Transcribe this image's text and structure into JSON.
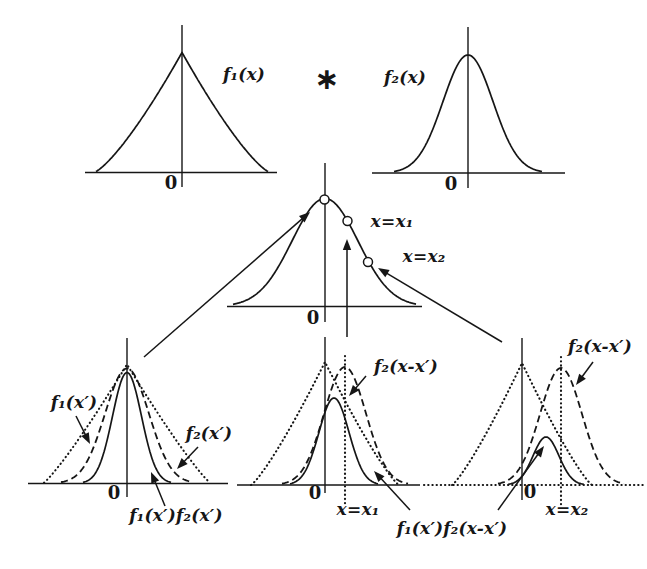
{
  "labels": {
    "f1_of_x": "f₁(x)",
    "star": "∗",
    "f2_of_x": "f₂(x)",
    "x_eq_x1": "x=x₁",
    "x_eq_x2": "x=x₂",
    "zero": "0",
    "f1_of_xp": "f₁(x′)",
    "f2_of_xp": "f₂(x′)",
    "f1f2_of_xp": "f₁(x′)f₂(x′)",
    "f2_of_x_minus_xp": "f₂(x-x′)",
    "f1f2_product": "f₁(x′)f₂(x-x′)"
  },
  "figure": {
    "ink": "#161616",
    "axes": [
      {
        "name": "axis-top-left-vertical",
        "x1": 182,
        "y1": 25,
        "x2": 182,
        "y2": 187
      },
      {
        "name": "axis-top-left-horizontal",
        "x1": 85,
        "y1": 172.5,
        "x2": 277,
        "y2": 172.5
      },
      {
        "name": "axis-top-right-vertical",
        "x1": 468,
        "y1": 27,
        "x2": 468,
        "y2": 188
      },
      {
        "name": "axis-top-right-horizontal",
        "x1": 372,
        "y1": 173,
        "x2": 565,
        "y2": 173
      },
      {
        "name": "axis-middle-vertical",
        "x1": 325,
        "y1": 163,
        "x2": 325,
        "y2": 322
      },
      {
        "name": "axis-middle-horizontal",
        "x1": 227,
        "y1": 306.5,
        "x2": 422,
        "y2": 306.5
      },
      {
        "name": "axis-bottom-left-vertical",
        "x1": 127,
        "y1": 338,
        "x2": 127,
        "y2": 497
      },
      {
        "name": "axis-bottom-left-horizontal",
        "x1": 28,
        "y1": 483.5,
        "x2": 228,
        "y2": 483.5
      },
      {
        "name": "axis-bottom-middle-vertical",
        "x1": 325,
        "y1": 337,
        "x2": 325,
        "y2": 493
      },
      {
        "name": "axis-bottom-middle-horizontal",
        "x1": 237,
        "y1": 485,
        "x2": 420,
        "y2": 485
      },
      {
        "name": "axis-bottom-right-vertical",
        "x1": 522,
        "y1": 338,
        "x2": 522,
        "y2": 500
      }
    ],
    "dotted_lines": [
      {
        "name": "baseline-dotted-extension",
        "x1": 424,
        "y1": 485,
        "x2": 643,
        "y2": 485
      },
      {
        "name": "x1-marker-dotted-line",
        "x1": 345,
        "y1": 356,
        "x2": 345,
        "y2": 505
      },
      {
        "name": "x2-marker-dotted-line",
        "x1": 561,
        "y1": 357,
        "x2": 561,
        "y2": 505
      }
    ],
    "curves": [
      {
        "name": "f1-top-curve",
        "kind": "tri",
        "cx": 182,
        "base": 172.5,
        "h": 120,
        "W": 88,
        "q": 1.3,
        "x0": 96,
        "x1": 268,
        "style": "solid"
      },
      {
        "name": "f2-top-curve",
        "kind": "gauss",
        "cx": 468,
        "base": 173,
        "h": 118,
        "sigma": 25,
        "x0": 394,
        "x1": 542,
        "style": "solid"
      },
      {
        "name": "convolution-curve",
        "kind": "gauss",
        "cx": 325,
        "base": 306.5,
        "h": 108,
        "sigma": 33,
        "x0": 233,
        "x1": 416,
        "style": "solid"
      },
      {
        "name": "bl-f1-curve",
        "kind": "tri",
        "cx": 127,
        "base": 483.5,
        "h": 119,
        "W": 84,
        "q": 1.15,
        "x0": 44,
        "x1": 210,
        "style": "dotted"
      },
      {
        "name": "bl-f2-curve",
        "kind": "gauss",
        "cx": 127,
        "base": 483.5,
        "h": 115,
        "sigma": 22,
        "x0": 61,
        "x1": 193,
        "style": "dashed"
      },
      {
        "name": "bl-product-curve",
        "kind": "gauss",
        "cx": 127,
        "base": 483.5,
        "h": 111,
        "sigma": 14.5,
        "x0": 83,
        "x1": 171,
        "style": "solid"
      },
      {
        "name": "bm-f1-curve",
        "kind": "tri",
        "cx": 325,
        "base": 485,
        "h": 123,
        "W": 74,
        "q": 1.2,
        "x0": 251,
        "x1": 399,
        "style": "dotted"
      },
      {
        "name": "bm-f2-curve",
        "kind": "gauss",
        "cx": 345,
        "base": 485,
        "h": 118,
        "sigma": 21,
        "x0": 282,
        "x1": 408,
        "style": "dashed"
      },
      {
        "name": "bm-product-curve",
        "kind": "gauss",
        "cx": 334,
        "base": 485,
        "h": 87,
        "sigma": 15,
        "x0": 290,
        "x1": 378,
        "style": "solid"
      },
      {
        "name": "br-f1-curve",
        "kind": "tri",
        "cx": 522,
        "base": 485,
        "h": 122,
        "W": 70,
        "q": 1.2,
        "x0": 452,
        "x1": 592,
        "style": "dotted"
      },
      {
        "name": "br-f2-curve",
        "kind": "gauss",
        "cx": 561,
        "base": 485,
        "h": 117,
        "sigma": 21,
        "x0": 498,
        "x1": 624,
        "style": "dashed"
      },
      {
        "name": "br-product-curve",
        "kind": "gauss",
        "cx": 546,
        "base": 485,
        "h": 48,
        "sigma": 13,
        "x0": 508,
        "x1": 584,
        "style": "solid"
      }
    ],
    "circles": [
      {
        "name": "point-at-peak",
        "cx": 324.5,
        "cy": 199.5,
        "r": 4.5
      },
      {
        "name": "point-at-x1",
        "cx": 347.5,
        "cy": 221,
        "r": 4.5
      },
      {
        "name": "point-at-x2",
        "cx": 368,
        "cy": 262,
        "r": 4.5
      }
    ],
    "arrows": [
      {
        "name": "arrow-to-peak-point",
        "x1": 144,
        "y1": 357,
        "x2": 310,
        "y2": 212
      },
      {
        "name": "arrow-to-x2-point",
        "x1": 502,
        "y1": 342,
        "x2": 378,
        "y2": 268
      },
      {
        "name": "arrow-up-at-x1",
        "x1": 347,
        "y1": 337,
        "x2": 347,
        "y2": 239
      },
      {
        "name": "arrow-f1xp-label",
        "x1": 76,
        "y1": 416,
        "x2": 90,
        "y2": 444
      },
      {
        "name": "arrow-f2xp-label",
        "x1": 198,
        "y1": 447,
        "x2": 177,
        "y2": 469
      },
      {
        "name": "arrow-f1f2xp-label",
        "x1": 165,
        "y1": 506,
        "x2": 151,
        "y2": 472
      },
      {
        "name": "arrow-f2shift-mid-label",
        "x1": 366,
        "y1": 376,
        "x2": 349,
        "y2": 396
      },
      {
        "name": "arrow-f2shift-right-label",
        "x1": 593,
        "y1": 362,
        "x2": 576,
        "y2": 385
      },
      {
        "name": "arrow-product-to-mid",
        "x1": 410,
        "y1": 510,
        "x2": 374,
        "y2": 471
      },
      {
        "name": "arrow-product-to-right",
        "x1": 498,
        "y1": 510,
        "x2": 544,
        "y2": 446
      }
    ]
  }
}
